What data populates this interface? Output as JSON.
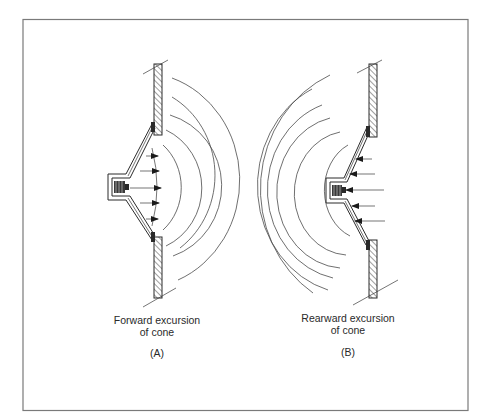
{
  "figure": {
    "panels": [
      {
        "id": "A",
        "caption_line1": "Forward excursion",
        "caption_line2": "of cone",
        "tag": "(A)",
        "wave_side": "front",
        "arrow_direction": "outward"
      },
      {
        "id": "B",
        "caption_line1": "Rearward excursion",
        "caption_line2": "of cone",
        "tag": "(B)",
        "wave_side": "rear",
        "arrow_direction": "inward"
      }
    ],
    "colors": {
      "ink": "#2a2a2a",
      "frame": "#7a7a7a",
      "background": "#ffffff"
    }
  }
}
